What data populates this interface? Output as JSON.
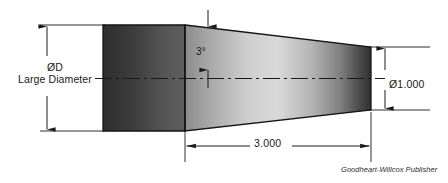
{
  "drawing": {
    "type": "engineering-drawing",
    "subject": "tapered-shaft-with-cylindrical-end",
    "credit": "Goodheart-Willcox Publisher",
    "background_color": "#ffffff",
    "line_color": "#1a1a1a",
    "dimensions": {
      "large_diameter": {
        "symbol": "ØD",
        "label": "Large Diameter",
        "position": "left",
        "value_text": "ØD"
      },
      "small_diameter": {
        "symbol": "Ø1.000",
        "position": "right",
        "value": 1.0,
        "units": "inch"
      },
      "taper_length": {
        "value_text": "3.000",
        "value": 3.0,
        "units": "inch",
        "position": "bottom"
      },
      "taper_angle": {
        "value_text": "3°",
        "value": 3,
        "units": "degrees",
        "position": "top-inside"
      }
    },
    "body": {
      "cylinder_fill_left": "#3a3a3a",
      "cylinder_fill_right": "#6e6e6e",
      "taper_fill_light": "#d8d8d8",
      "taper_fill_dark": "#2f2f2f",
      "outline_color": "#1a1a1a"
    },
    "centerline": {
      "style": "dash-dot",
      "color": "#1a1a1a"
    }
  }
}
